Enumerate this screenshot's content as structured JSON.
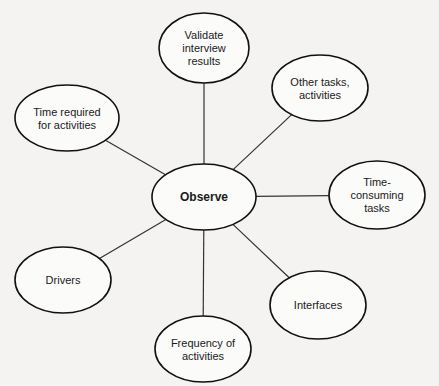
{
  "diagram": {
    "type": "mind-map",
    "colors": {
      "background": "#f4f3f1",
      "node_fill": "#fbfbfa",
      "stroke": "#111111"
    },
    "center": {
      "id": "observe",
      "lines": [
        "Observe"
      ],
      "cx": 204,
      "cy": 197,
      "rx": 52,
      "ry": 33
    },
    "nodes": [
      {
        "id": "validate",
        "lines": [
          "Validate",
          "interview",
          "results"
        ],
        "cx": 204,
        "cy": 48,
        "rx": 45,
        "ry": 35
      },
      {
        "id": "other-tasks",
        "lines": [
          "Other tasks,",
          "activities"
        ],
        "cx": 320,
        "cy": 88,
        "rx": 48,
        "ry": 33
      },
      {
        "id": "time-consuming",
        "lines": [
          "Time-",
          "consuming",
          "tasks"
        ],
        "cx": 377,
        "cy": 195,
        "rx": 48,
        "ry": 34
      },
      {
        "id": "interfaces",
        "lines": [
          "Interfaces"
        ],
        "cx": 318,
        "cy": 305,
        "rx": 48,
        "ry": 34
      },
      {
        "id": "frequency",
        "lines": [
          "Frequency of",
          "activities"
        ],
        "cx": 203,
        "cy": 349,
        "rx": 48,
        "ry": 33
      },
      {
        "id": "drivers",
        "lines": [
          "Drivers"
        ],
        "cx": 63,
        "cy": 280,
        "rx": 48,
        "ry": 33
      },
      {
        "id": "time-required",
        "lines": [
          "Time required",
          "for activities"
        ],
        "cx": 67,
        "cy": 118,
        "rx": 52,
        "ry": 33
      }
    ]
  }
}
